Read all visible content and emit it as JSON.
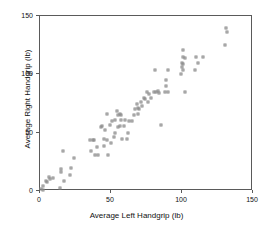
{
  "chart_data": {
    "type": "scatter",
    "title": "",
    "xlabel": "Average Left Handgrip (lb)",
    "ylabel": "Average Right Handgrip (lb)",
    "xlim": [
      0,
      150
    ],
    "ylim": [
      0,
      150
    ],
    "xticks": [
      0,
      50,
      100,
      150
    ],
    "yticks": [
      0,
      50,
      100,
      150
    ],
    "xticklabels": [
      "0",
      "50",
      "100",
      "150"
    ],
    "yticklabels": [
      "0",
      "50",
      "100",
      "150"
    ],
    "grid": false,
    "legend": null,
    "marker": "open-square",
    "marker_color": "#8a8a8a",
    "frame_color": "#5a5a5a",
    "series": [
      {
        "name": "subjects",
        "points": [
          [
            1,
            2
          ],
          [
            2,
            4
          ],
          [
            2,
            1
          ],
          [
            4,
            9
          ],
          [
            5,
            8
          ],
          [
            6,
            12
          ],
          [
            7,
            10
          ],
          [
            9,
            11
          ],
          [
            14,
            3
          ],
          [
            15,
            16
          ],
          [
            15,
            19
          ],
          [
            16,
            34
          ],
          [
            17,
            9
          ],
          [
            21,
            14
          ],
          [
            22,
            20
          ],
          [
            24,
            28
          ],
          [
            35,
            44
          ],
          [
            36,
            34
          ],
          [
            37,
            44
          ],
          [
            38,
            44
          ],
          [
            39,
            31
          ],
          [
            40,
            38
          ],
          [
            41,
            31
          ],
          [
            43,
            55
          ],
          [
            44,
            56
          ],
          [
            45,
            45
          ],
          [
            45,
            39
          ],
          [
            46,
            52
          ],
          [
            47,
            44
          ],
          [
            47,
            66
          ],
          [
            48,
            31
          ],
          [
            49,
            57
          ],
          [
            50,
            41
          ],
          [
            51,
            60
          ],
          [
            52,
            46
          ],
          [
            53,
            61
          ],
          [
            53,
            50
          ],
          [
            54,
            69
          ],
          [
            55,
            55
          ],
          [
            55,
            65
          ],
          [
            56,
            56
          ],
          [
            56,
            66
          ],
          [
            57,
            61
          ],
          [
            57,
            65
          ],
          [
            58,
            45
          ],
          [
            59,
            56
          ],
          [
            60,
            61
          ],
          [
            61,
            45
          ],
          [
            62,
            50
          ],
          [
            63,
            60
          ],
          [
            65,
            60
          ],
          [
            66,
            65
          ],
          [
            67,
            70
          ],
          [
            68,
            75
          ],
          [
            69,
            66
          ],
          [
            69,
            71
          ],
          [
            70,
            70
          ],
          [
            71,
            76
          ],
          [
            72,
            73
          ],
          [
            73,
            80
          ],
          [
            74,
            79
          ],
          [
            75,
            85
          ],
          [
            76,
            76
          ],
          [
            77,
            83
          ],
          [
            78,
            80
          ],
          [
            80,
            85
          ],
          [
            81,
            104
          ],
          [
            82,
            85
          ],
          [
            83,
            86
          ],
          [
            84,
            84
          ],
          [
            85,
            57
          ],
          [
            88,
            85
          ],
          [
            89,
            95
          ],
          [
            89,
            90
          ],
          [
            90,
            104
          ],
          [
            90,
            85
          ],
          [
            99,
            100
          ],
          [
            100,
            106
          ],
          [
            100,
            110
          ],
          [
            101,
            115
          ],
          [
            101,
            121
          ],
          [
            101,
            109
          ],
          [
            101,
            104
          ],
          [
            102,
            114
          ],
          [
            102,
            85
          ],
          [
            109,
            104
          ],
          [
            110,
            115
          ],
          [
            111,
            110
          ],
          [
            115,
            115
          ],
          [
            130,
            125
          ],
          [
            131,
            140
          ],
          [
            132,
            136
          ]
        ]
      }
    ]
  },
  "axis": {
    "xlabel": "Average Left Handgrip (lb)",
    "ylabel": "Average Right Handgrip (lb)"
  }
}
